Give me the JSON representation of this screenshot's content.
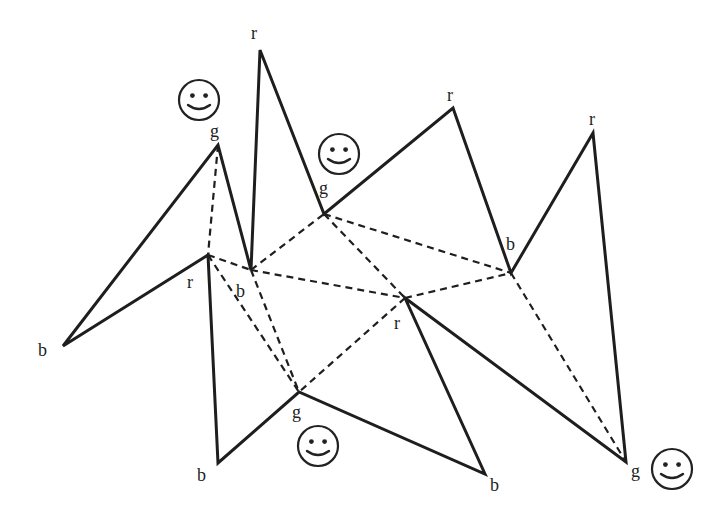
{
  "diagram": {
    "colors": {
      "line": "#1e1e1e",
      "background": "#ffffff"
    },
    "vertices": [
      {
        "id": "v1",
        "label": "b",
        "x": 63,
        "y": 346,
        "lx": 38,
        "ly": 356
      },
      {
        "id": "v2",
        "label": "g",
        "x": 218,
        "y": 145,
        "lx": 210,
        "ly": 137
      },
      {
        "id": "v3",
        "label": "b",
        "x": 251,
        "y": 270,
        "lx": 236,
        "ly": 297
      },
      {
        "id": "v4",
        "label": "r",
        "x": 260,
        "y": 50,
        "lx": 251,
        "ly": 39
      },
      {
        "id": "v5",
        "label": "g",
        "x": 324,
        "y": 214,
        "lx": 319,
        "ly": 194
      },
      {
        "id": "v6",
        "label": "r",
        "x": 453,
        "y": 108,
        "lx": 447,
        "ly": 101
      },
      {
        "id": "v7",
        "label": "b",
        "x": 511,
        "y": 273,
        "lx": 506,
        "ly": 250
      },
      {
        "id": "v8",
        "label": "r",
        "x": 593,
        "y": 133,
        "lx": 589,
        "ly": 125
      },
      {
        "id": "v9",
        "label": "g",
        "x": 626,
        "y": 462,
        "lx": 631,
        "ly": 477
      },
      {
        "id": "v10",
        "label": "r",
        "x": 208,
        "y": 255,
        "lx": 187,
        "ly": 288
      },
      {
        "id": "v11",
        "label": "r",
        "x": 405,
        "y": 298,
        "lx": 394,
        "ly": 329
      },
      {
        "id": "v12",
        "label": "g",
        "x": 299,
        "y": 392,
        "lx": 292,
        "ly": 418
      },
      {
        "id": "v13",
        "label": "b",
        "x": 218,
        "y": 463,
        "lx": 197,
        "ly": 481
      },
      {
        "id": "v14",
        "label": "b",
        "x": 485,
        "y": 474,
        "lx": 490,
        "ly": 491
      }
    ],
    "polygon_order": [
      "v1",
      "v2",
      "v3",
      "v4",
      "v5",
      "v6",
      "v7",
      "v8",
      "v9",
      "v11",
      "v14",
      "v12",
      "v13",
      "v10"
    ],
    "diagonals": [
      [
        "v2",
        "v10"
      ],
      [
        "v10",
        "v3"
      ],
      [
        "v10",
        "v12"
      ],
      [
        "v3",
        "v12"
      ],
      [
        "v3",
        "v5"
      ],
      [
        "v3",
        "v11"
      ],
      [
        "v5",
        "v11"
      ],
      [
        "v5",
        "v7"
      ],
      [
        "v11",
        "v7"
      ],
      [
        "v11",
        "v12"
      ],
      [
        "v7",
        "v9"
      ]
    ],
    "smileys": [
      {
        "name": "smiley-guard-1",
        "icon": "smiley-face-icon",
        "cx": 199,
        "cy": 100,
        "r": 20
      },
      {
        "name": "smiley-guard-2",
        "icon": "smiley-face-icon",
        "cx": 339,
        "cy": 154,
        "r": 20
      },
      {
        "name": "smiley-guard-3",
        "icon": "smiley-face-icon",
        "cx": 318,
        "cy": 446,
        "r": 20
      },
      {
        "name": "smiley-guard-4",
        "icon": "smiley-face-icon",
        "cx": 672,
        "cy": 469,
        "r": 20
      }
    ]
  }
}
